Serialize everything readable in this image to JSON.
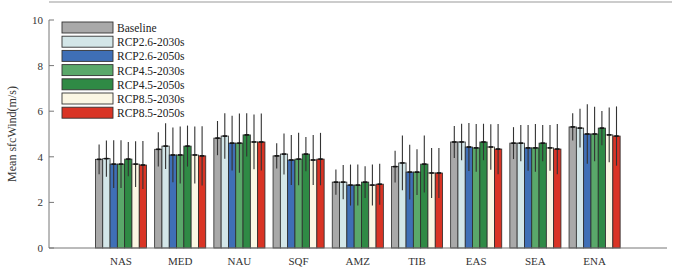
{
  "chart_data": {
    "type": "bar",
    "title": "",
    "xlabel": "",
    "ylabel": "Mean sfcWind(m/s)",
    "ylim": [
      0,
      10
    ],
    "yticks": [
      0,
      2,
      4,
      6,
      8,
      10
    ],
    "grid": false,
    "legend_position": "upper left",
    "categories": [
      "NAS",
      "MED",
      "NAU",
      "SQF",
      "AMZ",
      "TIB",
      "EAS",
      "SEA",
      "ENA"
    ],
    "series": [
      {
        "name": "Baseline",
        "color": "#a9a9a9",
        "values": [
          3.89,
          4.33,
          4.82,
          4.04,
          2.89,
          3.57,
          4.65,
          4.6,
          5.31
        ],
        "errors": [
          0.65,
          0.75,
          0.75,
          0.55,
          0.55,
          0.7,
          0.7,
          0.7,
          0.6
        ]
      },
      {
        "name": "RCP2.6-2030s",
        "color": "#d3e6e8",
        "values": [
          3.92,
          4.47,
          4.91,
          4.12,
          2.89,
          3.73,
          4.65,
          4.6,
          5.26
        ],
        "errors": [
          0.8,
          1.0,
          1.0,
          0.9,
          0.75,
          1.2,
          0.8,
          0.8,
          0.85
        ]
      },
      {
        "name": "RCP2.6-2050s",
        "color": "#3f6fb6",
        "values": [
          3.68,
          4.08,
          4.6,
          3.86,
          2.76,
          3.33,
          4.43,
          4.39,
          5.0
        ],
        "errors": [
          1.05,
          1.2,
          1.2,
          1.1,
          0.9,
          1.2,
          1.05,
          1.0,
          1.3
        ]
      },
      {
        "name": "RCP4.5-2030s",
        "color": "#5aa86a",
        "values": [
          3.68,
          4.08,
          4.6,
          3.9,
          2.76,
          3.33,
          4.39,
          4.39,
          5.0
        ],
        "errors": [
          1.05,
          1.25,
          1.3,
          1.15,
          0.9,
          1.0,
          1.05,
          1.05,
          1.2
        ]
      },
      {
        "name": "RCP4.5-2050s",
        "color": "#2f8a45",
        "values": [
          3.9,
          4.47,
          4.96,
          4.12,
          2.89,
          3.68,
          4.65,
          4.6,
          5.26
        ],
        "errors": [
          0.75,
          0.9,
          0.95,
          0.75,
          0.7,
          1.25,
          0.8,
          0.8,
          0.75
        ]
      },
      {
        "name": "RCP8.5-2030s",
        "color": "#fbf7e4",
        "values": [
          3.68,
          4.08,
          4.65,
          3.86,
          2.76,
          3.29,
          4.43,
          4.39,
          4.96
        ],
        "errors": [
          1.0,
          1.25,
          1.2,
          1.1,
          0.9,
          1.1,
          1.0,
          1.0,
          1.2
        ]
      },
      {
        "name": "RCP8.5-2050s",
        "color": "#d93425",
        "values": [
          3.64,
          4.04,
          4.65,
          3.9,
          2.8,
          3.29,
          4.34,
          4.34,
          4.91
        ],
        "errors": [
          1.05,
          1.3,
          1.25,
          1.15,
          0.9,
          1.1,
          1.1,
          1.1,
          1.3
        ]
      }
    ]
  }
}
